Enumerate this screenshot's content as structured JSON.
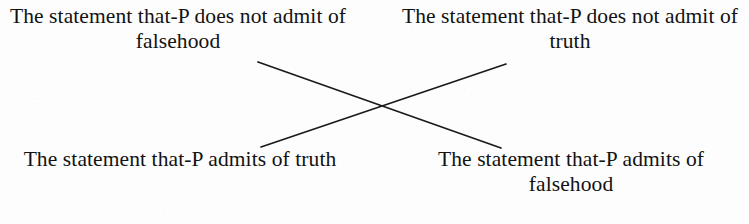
{
  "diagram": {
    "type": "logical-opposition-square",
    "background_color": "#fdfdfd",
    "text_color": "#121212",
    "line_color": "#1a1a1a",
    "propositions": {
      "top_left": "The statement that-P does not admit of falsehood",
      "top_right": "The statement that-P does not admit of truth",
      "bottom_left": "The statement that-P admits of truth",
      "bottom_right": "The statement that-P admits of falsehood"
    },
    "connectors": [
      {
        "name": "diagonal-top-left-to-bottom-right",
        "from": "top_left",
        "to": "bottom_right",
        "x1": 258,
        "y1": 62,
        "x2": 501,
        "y2": 148
      },
      {
        "name": "diagonal-bottom-left-to-top-right",
        "from": "bottom_left",
        "to": "top_right",
        "x1": 261,
        "y1": 147,
        "x2": 506,
        "y2": 64
      }
    ],
    "crossing_point": {
      "x": 381,
      "y": 106
    }
  }
}
